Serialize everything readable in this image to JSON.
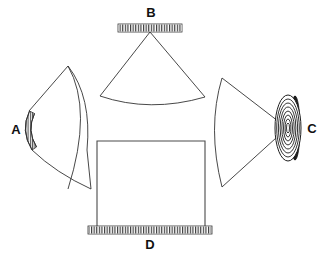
{
  "figure": {
    "type": "optical-schematic",
    "background_color": "#ffffff",
    "line_color": "#2b2b2b",
    "label_color": "#111111",
    "width": 326,
    "height": 254
  },
  "labels": {
    "a": "A",
    "b": "B",
    "c": "C",
    "d": "D"
  },
  "components": [
    {
      "id": "a",
      "label": "A",
      "name": "curved-hatched-grating",
      "shape": "curved hatched arc with fan beam",
      "label_x": 16,
      "label_y": 134
    },
    {
      "id": "b",
      "label": "B",
      "name": "flat-hatched-grating-top",
      "shape": "horizontal hatched bar with fan beam",
      "label_x": 151,
      "label_y": 17
    },
    {
      "id": "c",
      "label": "C",
      "name": "concentric-ring-detector",
      "shape": "ringed disc in perspective with fan beam",
      "label_x": 312,
      "label_y": 133
    },
    {
      "id": "d",
      "label": "D",
      "name": "flat-hatched-grating-bottom",
      "shape": "horizontal hatched bar with rectangular body",
      "label_x": 150,
      "label_y": 249
    }
  ]
}
